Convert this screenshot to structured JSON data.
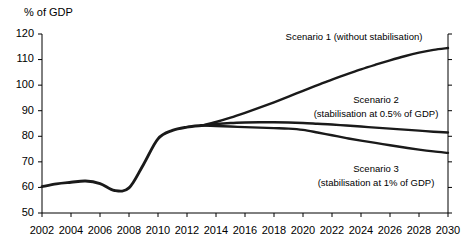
{
  "chart_data": {
    "type": "line",
    "title": "",
    "subtitle": "",
    "ylabel": "% of GDP",
    "xlabel": "",
    "ylim": [
      50,
      120
    ],
    "xlim": [
      2002,
      2030
    ],
    "grid": false,
    "legend_position": "inline-annotations",
    "y_ticks": [
      "120",
      "110",
      "100",
      "90",
      "80",
      "70",
      "60",
      "50"
    ],
    "y_tick_values": [
      120,
      110,
      100,
      90,
      80,
      70,
      60,
      50
    ],
    "x_ticks": [
      "2002",
      "2004",
      "2006",
      "2008",
      "2010",
      "2012",
      "2014",
      "2016",
      "2018",
      "2020",
      "2022",
      "2024",
      "2026",
      "2028",
      "2030"
    ],
    "x_tick_values": [
      2002,
      2004,
      2006,
      2008,
      2010,
      2012,
      2014,
      2016,
      2018,
      2020,
      2022,
      2024,
      2026,
      2028,
      2030
    ],
    "x": [
      2002,
      2003,
      2004,
      2005,
      2006,
      2007,
      2008,
      2009,
      2010,
      2011,
      2012,
      2013,
      2014,
      2015,
      2016,
      2017,
      2018,
      2019,
      2020,
      2021,
      2022,
      2023,
      2024,
      2025,
      2026,
      2027,
      2028,
      2029,
      2030
    ],
    "series": [
      {
        "name": "Historical",
        "label": "",
        "color": "#1a1a1a",
        "x": [
          2002,
          2003,
          2004,
          2005,
          2006,
          2007,
          2008,
          2009,
          2010,
          2011,
          2012,
          2013
        ],
        "values": [
          60.3,
          61.4,
          62.0,
          62.5,
          61.5,
          58.8,
          59.8,
          69.0,
          79.0,
          82.3,
          83.6,
          84.2
        ]
      },
      {
        "name": "Scenario 1",
        "label": "Scenario 1 (without stabilisation)",
        "color": "#1a1a1a",
        "x": [
          2013,
          2014,
          2015,
          2016,
          2017,
          2018,
          2019,
          2020,
          2021,
          2022,
          2023,
          2024,
          2025,
          2026,
          2027,
          2028,
          2029,
          2030
        ],
        "values": [
          84.2,
          85.6,
          87.3,
          89.2,
          91.2,
          93.3,
          95.5,
          97.8,
          100.0,
          102.2,
          104.2,
          106.2,
          108.0,
          109.7,
          111.3,
          112.7,
          113.8,
          114.5
        ]
      },
      {
        "name": "Scenario 2",
        "label": "Scenario 2 (stabilisation at 0.5% of GDP)",
        "color": "#1a1a1a",
        "x": [
          2013,
          2014,
          2015,
          2016,
          2017,
          2018,
          2019,
          2020,
          2021,
          2022,
          2023,
          2024,
          2025,
          2026,
          2027,
          2028,
          2029,
          2030
        ],
        "values": [
          84.2,
          84.8,
          85.2,
          85.4,
          85.5,
          85.5,
          85.4,
          85.2,
          84.9,
          84.6,
          84.2,
          83.8,
          83.4,
          83.0,
          82.6,
          82.2,
          81.8,
          81.5
        ]
      },
      {
        "name": "Scenario 3",
        "label": "Scenario 3 (stabilisation at 1% of GDP)",
        "color": "#1a1a1a",
        "x": [
          2013,
          2014,
          2015,
          2016,
          2017,
          2018,
          2019,
          2020,
          2021,
          2022,
          2023,
          2024,
          2025,
          2026,
          2027,
          2028,
          2029,
          2030
        ],
        "values": [
          84.2,
          84.0,
          83.8,
          83.6,
          83.4,
          83.2,
          83.0,
          82.5,
          81.5,
          80.4,
          79.3,
          78.3,
          77.4,
          76.5,
          75.6,
          74.8,
          74.1,
          73.5
        ]
      }
    ],
    "annotations": [
      {
        "name": "scenario-1-label",
        "text": "Scenario 1 (without stabilisation)",
        "x_px": 354,
        "y_px": 40
      },
      {
        "name": "scenario-2-label-line1",
        "text": "Scenario 2",
        "x_px": 376,
        "y_px": 103
      },
      {
        "name": "scenario-2-label-line2",
        "text": "(stabilisation at 0.5% of GDP)",
        "x_px": 376,
        "y_px": 117
      },
      {
        "name": "scenario-3-label-line1",
        "text": "Scenario 3",
        "x_px": 376,
        "y_px": 172
      },
      {
        "name": "scenario-3-label-line2",
        "text": "(stabilisation at 1% of GDP)",
        "x_px": 376,
        "y_px": 186
      }
    ]
  }
}
